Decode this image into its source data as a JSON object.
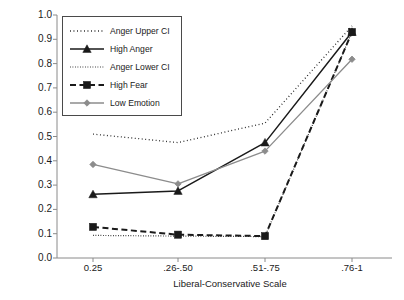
{
  "chart_data": {
    "type": "line",
    "title": "",
    "xlabel": "Liberal-Conservative Scale",
    "ylabel": "% Voted for the Senate Republican Candidate",
    "categories": [
      "0.25",
      ".26-.50",
      ".51-.75",
      ".76-1"
    ],
    "ylim": [
      0.0,
      1.0
    ],
    "ytick_labels": [
      "0.0",
      "0.1",
      "0.2",
      "0.3",
      "0.4",
      "0.5",
      "0.6",
      "0.7",
      "0.8",
      "0.9",
      "1.0"
    ],
    "ytick_values": [
      0.0,
      0.1,
      0.2,
      0.3,
      0.4,
      0.5,
      0.6,
      0.7,
      0.8,
      0.9,
      1.0
    ],
    "grid": false,
    "legend_position": "upper-left-inside",
    "series": [
      {
        "name": "Anger Upper CI",
        "values": [
          0.51,
          0.475,
          0.555,
          0.955
        ],
        "color": "#1a1a1a",
        "style": "dotted-coarse",
        "marker": "none",
        "width": 1.3
      },
      {
        "name": "High Anger",
        "values": [
          0.262,
          0.276,
          0.475,
          0.93
        ],
        "color": "#1a1a1a",
        "style": "solid",
        "marker": "triangle",
        "width": 1.5
      },
      {
        "name": "Anger Lower CI",
        "values": [
          0.093,
          0.09,
          0.088,
          0.93
        ],
        "color": "#1a1a1a",
        "style": "dotted-fine",
        "marker": "none",
        "width": 1.2
      },
      {
        "name": "High Fear",
        "values": [
          0.128,
          0.096,
          0.09,
          0.93
        ],
        "color": "#1a1a1a",
        "style": "dashed",
        "marker": "square",
        "width": 2.0
      },
      {
        "name": "Low Emotion",
        "values": [
          0.385,
          0.305,
          0.44,
          0.818
        ],
        "color": "#8c8c8c",
        "style": "solid",
        "marker": "diamond",
        "width": 1.3
      }
    ]
  },
  "axis": {
    "color": "#8a8a8a"
  }
}
